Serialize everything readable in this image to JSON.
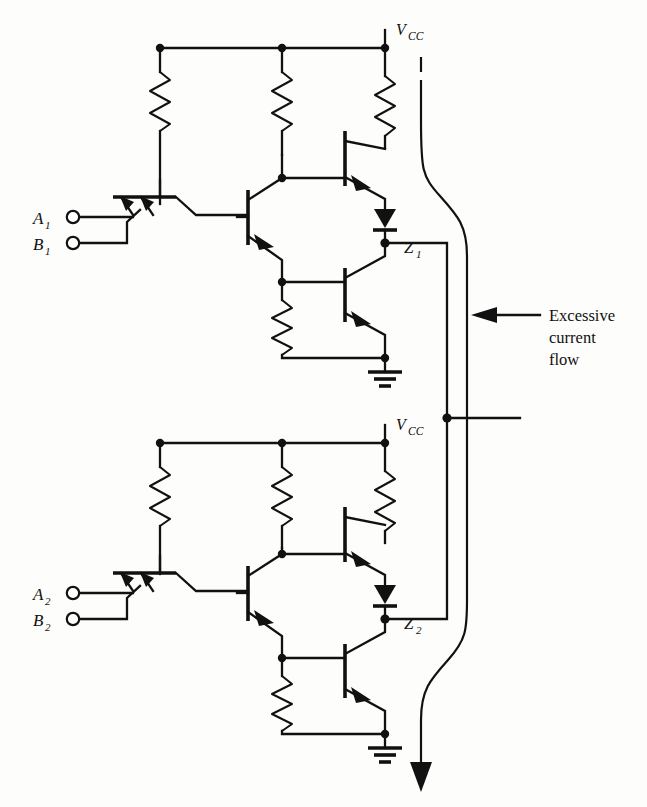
{
  "figure": {
    "background_color": "#fdfdfb",
    "ink_color": "#111111"
  },
  "annotation": {
    "arrow_icon": "left-arrow-icon",
    "line1": "Excessive",
    "line2": "current",
    "line3": "flow"
  },
  "gates": [
    {
      "id": "gate-1",
      "supply_label": "V",
      "supply_sub": "CC",
      "inputs": [
        {
          "name": "A",
          "sub": "1"
        },
        {
          "name": "B",
          "sub": "1"
        }
      ],
      "output": {
        "name": "Z",
        "sub": "1"
      },
      "ground_icon": "ground-icon",
      "components": {
        "resistors": 4,
        "transistors": 4,
        "diodes": 1
      }
    },
    {
      "id": "gate-2",
      "supply_label": "V",
      "supply_sub": "CC",
      "inputs": [
        {
          "name": "A",
          "sub": "2"
        },
        {
          "name": "B",
          "sub": "2"
        }
      ],
      "output": {
        "name": "Z",
        "sub": "2"
      },
      "ground_icon": "ground-icon",
      "components": {
        "resistors": 4,
        "transistors": 4,
        "diodes": 1
      }
    }
  ],
  "fault_path": {
    "icon": "current-flow-arrow-icon",
    "description_visible": false
  }
}
